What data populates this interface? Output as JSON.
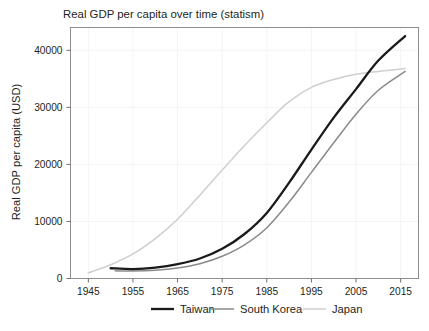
{
  "chart_data": {
    "type": "line",
    "title": "Real GDP per capita over time (statism)",
    "xlabel": "",
    "ylabel": "Real GDP per capita (USD)",
    "xlim": [
      1941,
      2019
    ],
    "ylim": [
      0,
      44000
    ],
    "xticks": [
      1945,
      1955,
      1965,
      1975,
      1985,
      1995,
      2005,
      2015
    ],
    "yticks": [
      0,
      10000,
      20000,
      30000,
      40000
    ],
    "xtick_labels": [
      "1945",
      "1955",
      "1965",
      "1975",
      "1985",
      "1995",
      "2005",
      "2015"
    ],
    "ytick_labels": [
      "0",
      "10000",
      "20000",
      "30000",
      "40000"
    ],
    "grid": true,
    "legend_position": "bottom",
    "series": [
      {
        "name": "Taiwan",
        "color": "#1a1a1a",
        "width": 2.3,
        "x": [
          1950,
          1955,
          1960,
          1965,
          1970,
          1975,
          1980,
          1985,
          1990,
          1995,
          2000,
          2005,
          2010,
          2016
        ],
        "values": [
          1800,
          1650,
          1900,
          2500,
          3500,
          5200,
          7800,
          11500,
          16800,
          22600,
          28200,
          33200,
          38200,
          42500
        ]
      },
      {
        "name": "South Korea",
        "color": "#8a8a8a",
        "width": 1.5,
        "x": [
          1951,
          1955,
          1960,
          1965,
          1970,
          1975,
          1980,
          1985,
          1990,
          1995,
          2000,
          2005,
          2010,
          2016
        ],
        "values": [
          1350,
          1300,
          1450,
          1850,
          2600,
          3900,
          5900,
          8900,
          13400,
          18600,
          23800,
          28800,
          33000,
          36300
        ]
      },
      {
        "name": "Japan",
        "color": "#cfcfcf",
        "width": 1.5,
        "x": [
          1945,
          1950,
          1955,
          1960,
          1965,
          1970,
          1975,
          1980,
          1985,
          1990,
          1995,
          2000,
          2005,
          2010,
          2016
        ],
        "values": [
          1000,
          2400,
          4300,
          7000,
          10400,
          14600,
          19000,
          23300,
          27300,
          31000,
          33500,
          34900,
          35800,
          36300,
          36800
        ]
      }
    ]
  },
  "legend": {
    "items": [
      {
        "label": "Taiwan"
      },
      {
        "label": "South Korea"
      },
      {
        "label": "Japan"
      }
    ]
  }
}
